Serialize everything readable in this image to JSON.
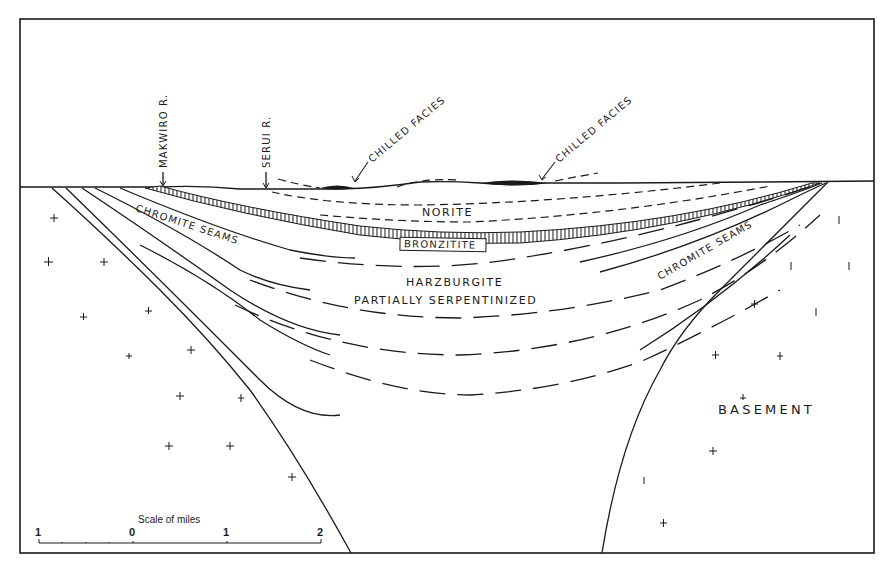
{
  "figure": {
    "type": "geological cross-section",
    "colors": {
      "ink": "#1a1a1a",
      "background": "#ffffff"
    }
  },
  "labels": {
    "makwiro": "MAKWIRO R.",
    "serui": "SERUI R.",
    "chilled_left": "CHILLED FACIES",
    "chilled_right": "CHILLED FACIES",
    "norite": "NORITE",
    "bronzitite": "BRONZITITE",
    "chromite_left": "CHROMITE  SEAMS",
    "chromite_right": "CHROMITE  SEAMS",
    "harzburgite": "HARZBURGITE",
    "partially": "PARTIALLY  SERPENTINIZED",
    "basement": "BASEMENT"
  },
  "scale_bar": {
    "title": "Scale of miles",
    "ticks": [
      "1",
      "0",
      "1",
      "2"
    ],
    "unit": "miles"
  },
  "layers": [
    {
      "name": "Chilled facies",
      "symbol": "solid black lens"
    },
    {
      "name": "Norite",
      "symbol": "blank, dashed boundaries"
    },
    {
      "name": "Bronzitite",
      "symbol": "vertical hatching band"
    },
    {
      "name": "Harzburgite partially serpentinized",
      "symbol": "long-dashed boundaries"
    },
    {
      "name": "Chromite seams",
      "symbol": "solid lines"
    },
    {
      "name": "Basement",
      "symbol": "crosses"
    }
  ]
}
